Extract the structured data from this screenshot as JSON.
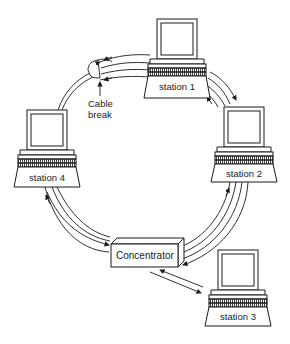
{
  "diagram": {
    "type": "token-ring network with concentrator (MAU)",
    "stations": [
      {
        "id": "station-1",
        "label": "station 1"
      },
      {
        "id": "station-2",
        "label": "station 2"
      },
      {
        "id": "station-3",
        "label": "station 3"
      },
      {
        "id": "station-4",
        "label": "station 4"
      }
    ],
    "hub": {
      "label": "Concentrator"
    },
    "annotation": {
      "line1": "Cable",
      "line2": "break"
    },
    "colors": {
      "stroke": "#1a1a1a",
      "fill": "#ffffff",
      "pattern": "#555555"
    }
  }
}
